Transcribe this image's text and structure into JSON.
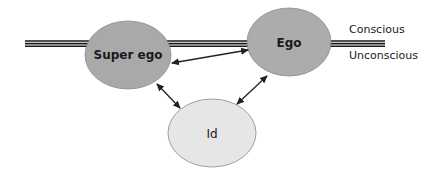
{
  "diagram": {
    "boundary": {
      "label_above": "Conscious",
      "label_below": "Unconscious"
    },
    "nodes": [
      {
        "id": "superego",
        "label": "Super ego",
        "fill": "#a9a9a9",
        "bold": true
      },
      {
        "id": "ego",
        "label": "Ego",
        "fill": "#acacac",
        "bold": true
      },
      {
        "id": "id",
        "label": "Id",
        "fill": "#e6e6e6",
        "bold": false
      }
    ],
    "edges": [
      {
        "from": "superego",
        "to": "ego",
        "direction": "both"
      },
      {
        "from": "superego",
        "to": "id",
        "direction": "both"
      },
      {
        "from": "ego",
        "to": "id",
        "direction": "both"
      }
    ],
    "colors": {
      "line": "#1a1a1a",
      "node_stroke": "#8a8a8a",
      "arrow": "#222222"
    }
  }
}
